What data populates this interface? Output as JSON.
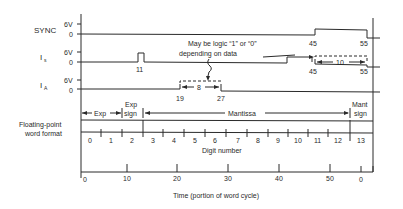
{
  "signals": [
    {
      "name": "SYNC",
      "sub": "",
      "high_label": "6V",
      "low_label": "0",
      "edges": [
        "45",
        "55"
      ]
    },
    {
      "name": "I",
      "sub": "s",
      "high_label": "6V",
      "low_label": "0",
      "pulse_label": "11",
      "edges": [
        "45",
        "55"
      ],
      "duration_label": "10"
    },
    {
      "name": "I",
      "sub": "A",
      "high_label": "6V",
      "low_label": "0",
      "edges": [
        "19",
        "27"
      ],
      "duration_label": "8"
    }
  ],
  "annotation": {
    "line1": "May be logic “1” or “0”",
    "line2": "depending on data"
  },
  "word_format": {
    "label_line1": "Floating-point",
    "label_line2": "word format",
    "fields": [
      {
        "label": "Exp"
      },
      {
        "label_line1": "Exp",
        "label_line2": "sign"
      },
      {
        "label": "Mantissa"
      },
      {
        "label_line1": "Mant",
        "label_line2": "sign"
      }
    ],
    "digits": [
      "0",
      "1",
      "2",
      "3",
      "4",
      "5",
      "6",
      "7",
      "8",
      "9",
      "10",
      "11",
      "12",
      "13"
    ],
    "digit_axis_label": "Digit number"
  },
  "time_axis": {
    "ticks": [
      "0",
      "10",
      "20",
      "30",
      "40",
      "50",
      "0"
    ],
    "label": "Time (portion of word cycle)"
  }
}
